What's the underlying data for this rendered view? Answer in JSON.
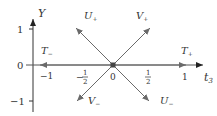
{
  "diagram": {
    "type": "root-diagram",
    "colors": {
      "axis": "#333333",
      "arrow": "#6a6a6a",
      "text": "#333333",
      "origin": "#444444"
    },
    "axes": {
      "vertical": {
        "label": "Y",
        "ticks": [
          {
            "label": "1",
            "value": 1
          },
          {
            "label": "0",
            "value": 0
          },
          {
            "label": "−1",
            "value": -1
          }
        ]
      },
      "horizontal": {
        "label": "t",
        "label_subscript": "3",
        "ticks": [
          {
            "label": "−1",
            "value": -1
          },
          {
            "label": "−",
            "num": "1",
            "den": "2",
            "value": -0.5
          },
          {
            "label": "0",
            "value": 0
          },
          {
            "label": "",
            "num": "1",
            "den": "2",
            "value": 0.5
          },
          {
            "label": "1",
            "value": 1
          }
        ]
      }
    },
    "vectors": [
      {
        "name": "U",
        "sub": "+",
        "direction": "upper-left"
      },
      {
        "name": "V",
        "sub": "+",
        "direction": "upper-right"
      },
      {
        "name": "V",
        "sub": "−",
        "direction": "lower-left"
      },
      {
        "name": "U",
        "sub": "−",
        "direction": "lower-right"
      },
      {
        "name": "T",
        "sub": "+",
        "direction": "right"
      },
      {
        "name": "T",
        "sub": "−",
        "direction": "left"
      }
    ]
  }
}
